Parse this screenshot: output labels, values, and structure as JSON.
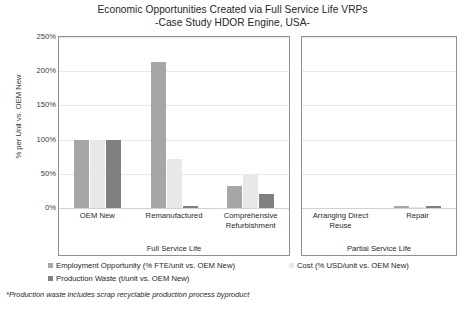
{
  "chart_data": {
    "type": "bar",
    "title": "Economic Opportunities Created via Full Service Life VRPs",
    "subtitle": "-Case Study HDOR Engine, USA-",
    "xlabel": "",
    "ylabel": "% per Unit vs. OEM New",
    "ylim": [
      0,
      250
    ],
    "ytick_labels": [
      "250%",
      "200%",
      "150%",
      "100%",
      "50%",
      "0%"
    ],
    "ytick_values": [
      250,
      200,
      150,
      100,
      50,
      0
    ],
    "grid": true,
    "legend_position": "bottom",
    "panels": [
      {
        "name": "Full Service Life",
        "categories": [
          "OEM New",
          "Remanufactured",
          "Comprehensive Refurbishment"
        ],
        "series": [
          {
            "name": "Employment Opportunity (% FTE/unit vs. OEM New)",
            "color": "#a6a6a6",
            "values": [
              100,
              213,
              32
            ]
          },
          {
            "name": "Cost (% USD/unit vs. OEM New)",
            "color": "#e8e8e8",
            "values": [
              100,
              72,
              48
            ]
          },
          {
            "name": "Production Waste (t/unit vs. OEM New)",
            "color": "#808080",
            "values": [
              100,
              3,
              20
            ]
          }
        ]
      },
      {
        "name": "Partial Service Life",
        "categories": [
          "Arranging Direct Reuse",
          "Repair"
        ],
        "series": [
          {
            "name": "Employment Opportunity (% FTE/unit vs. OEM New)",
            "color": "#a6a6a6",
            "values": [
              0,
              3
            ]
          },
          {
            "name": "Cost (% USD/unit vs. OEM New)",
            "color": "#e8e8e8",
            "values": [
              0,
              2
            ]
          },
          {
            "name": "Production Waste (t/unit vs. OEM New)",
            "color": "#808080",
            "values": [
              0,
              3
            ]
          }
        ]
      }
    ],
    "legend": [
      {
        "label": "Employment Opportunity (% FTE/unit vs. OEM New)",
        "color": "#a6a6a6"
      },
      {
        "label": "Cost (% USD/unit vs. OEM New)",
        "color": "#e8e8e8"
      },
      {
        "label": "Production Waste (t/unit vs. OEM New)",
        "color": "#808080"
      }
    ],
    "footnote": "*Production waste includes scrap recyclable production process byproduct"
  }
}
